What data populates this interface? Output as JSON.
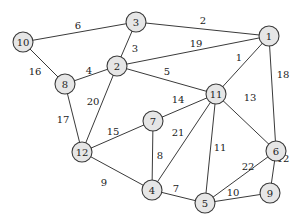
{
  "graph": {
    "type": "weighted-undirected-graph",
    "colors": {
      "node_fill": "#e6e6e6",
      "stroke": "#3a3a3a",
      "text": "#222222",
      "background": "#ffffff"
    },
    "nodes": [
      {
        "id": "1",
        "x": 269,
        "y": 36
      },
      {
        "id": "2",
        "x": 117,
        "y": 66
      },
      {
        "id": "3",
        "x": 136,
        "y": 22
      },
      {
        "id": "4",
        "x": 152,
        "y": 190
      },
      {
        "id": "5",
        "x": 205,
        "y": 203
      },
      {
        "id": "6",
        "x": 276,
        "y": 151
      },
      {
        "id": "7",
        "x": 153,
        "y": 121
      },
      {
        "id": "8",
        "x": 65,
        "y": 84
      },
      {
        "id": "9",
        "x": 270,
        "y": 193
      },
      {
        "id": "10",
        "x": 23,
        "y": 42
      },
      {
        "id": "11",
        "x": 216,
        "y": 94
      },
      {
        "id": "12",
        "x": 82,
        "y": 152
      }
    ],
    "edges": [
      {
        "from": "10",
        "to": "3",
        "weight": "6",
        "lx": 78,
        "ly": 25
      },
      {
        "from": "3",
        "to": "1",
        "weight": "2",
        "lx": 203,
        "ly": 20
      },
      {
        "from": "10",
        "to": "8",
        "weight": "16",
        "lx": 35,
        "ly": 71
      },
      {
        "from": "3",
        "to": "2",
        "weight": "3",
        "lx": 135,
        "ly": 48
      },
      {
        "from": "2",
        "to": "1",
        "weight": "19",
        "lx": 196,
        "ly": 43
      },
      {
        "from": "8",
        "to": "2",
        "weight": "4",
        "lx": 89,
        "ly": 70
      },
      {
        "from": "2",
        "to": "11",
        "weight": "5",
        "lx": 167,
        "ly": 71
      },
      {
        "from": "11",
        "to": "1",
        "weight": "1",
        "lx": 239,
        "ly": 57
      },
      {
        "from": "1",
        "to": "6",
        "weight": "18",
        "lx": 283,
        "ly": 74
      },
      {
        "from": "2",
        "to": "12",
        "weight": "20",
        "lx": 93,
        "ly": 101
      },
      {
        "from": "8",
        "to": "12",
        "weight": "17",
        "lx": 63,
        "ly": 119
      },
      {
        "from": "11",
        "to": "7",
        "weight": "14",
        "lx": 178,
        "ly": 99
      },
      {
        "from": "11",
        "to": "6",
        "weight": "13",
        "lx": 250,
        "ly": 97
      },
      {
        "from": "12",
        "to": "7",
        "weight": "15",
        "lx": 113,
        "ly": 131
      },
      {
        "from": "11",
        "to": "4",
        "weight": "21",
        "lx": 178,
        "ly": 132
      },
      {
        "from": "7",
        "to": "4",
        "weight": "8",
        "lx": 160,
        "ly": 155
      },
      {
        "from": "11",
        "to": "5",
        "weight": "11",
        "lx": 220,
        "ly": 147
      },
      {
        "from": "6",
        "to": "5",
        "weight": "22",
        "lx": 248,
        "ly": 166
      },
      {
        "from": "6",
        "to": "9",
        "weight": "12",
        "lx": 283,
        "ly": 158
      },
      {
        "from": "12",
        "to": "4",
        "weight": "9",
        "lx": 104,
        "ly": 182
      },
      {
        "from": "4",
        "to": "5",
        "weight": "7",
        "lx": 176,
        "ly": 188
      },
      {
        "from": "5",
        "to": "9",
        "weight": "10",
        "lx": 233,
        "ly": 192
      }
    ],
    "node_radius": 10
  }
}
